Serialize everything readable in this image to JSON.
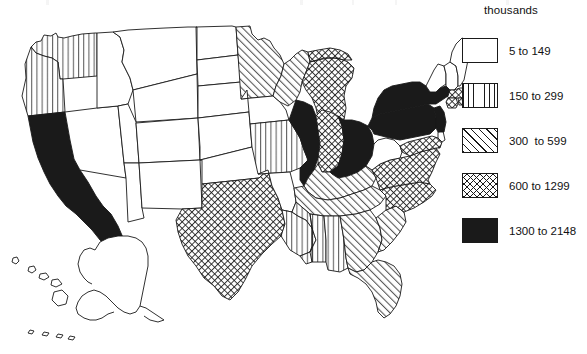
{
  "legend": {
    "title": "thousands",
    "classes": [
      {
        "pattern": "blank",
        "label": "5 to 149",
        "color": "#ffffff"
      },
      {
        "pattern": "vertical",
        "label": "150 to 299",
        "color": "#ffffff"
      },
      {
        "pattern": "diagonal",
        "label": "300  to 599",
        "color": "#ffffff"
      },
      {
        "pattern": "crosshatch",
        "label": "600 to 1299",
        "color": "#ffffff"
      },
      {
        "pattern": "solid",
        "label": "1300 to 2148",
        "color": "#1a1a1a"
      }
    ]
  },
  "chart_data": {
    "type": "map",
    "title": "",
    "units": "thousands",
    "legend_position": "right",
    "classes": [
      "5 to 149",
      "150 to 299",
      "300  to 599",
      "600 to 1299",
      "1300 to 2148"
    ],
    "class_patterns": [
      "blank",
      "vertical",
      "diagonal",
      "crosshatch",
      "solid"
    ],
    "states": [
      {
        "code": "WA",
        "name": "Washington",
        "class": 1
      },
      {
        "code": "OR",
        "name": "Oregon",
        "class": 1
      },
      {
        "code": "CA",
        "name": "California",
        "class": 4
      },
      {
        "code": "NV",
        "name": "Nevada",
        "class": 0
      },
      {
        "code": "ID",
        "name": "Idaho",
        "class": 0
      },
      {
        "code": "MT",
        "name": "Montana",
        "class": 0
      },
      {
        "code": "WY",
        "name": "Wyoming",
        "class": 0
      },
      {
        "code": "UT",
        "name": "Utah",
        "class": 0
      },
      {
        "code": "AZ",
        "name": "Arizona",
        "class": 0
      },
      {
        "code": "CO",
        "name": "Colorado",
        "class": 0
      },
      {
        "code": "NM",
        "name": "New Mexico",
        "class": 0
      },
      {
        "code": "ND",
        "name": "North Dakota",
        "class": 0
      },
      {
        "code": "SD",
        "name": "South Dakota",
        "class": 0
      },
      {
        "code": "NE",
        "name": "Nebraska",
        "class": 0
      },
      {
        "code": "KS",
        "name": "Kansas",
        "class": 0
      },
      {
        "code": "OK",
        "name": "Oklahoma",
        "class": 0
      },
      {
        "code": "TX",
        "name": "Texas",
        "class": 3
      },
      {
        "code": "MN",
        "name": "Minnesota",
        "class": 2
      },
      {
        "code": "IA",
        "name": "Iowa",
        "class": 0
      },
      {
        "code": "MO",
        "name": "Missouri",
        "class": 1
      },
      {
        "code": "AR",
        "name": "Arkansas",
        "class": 0
      },
      {
        "code": "LA",
        "name": "Louisiana",
        "class": 1
      },
      {
        "code": "WI",
        "name": "Wisconsin",
        "class": 2
      },
      {
        "code": "IL",
        "name": "Illinois",
        "class": 4
      },
      {
        "code": "MI",
        "name": "Michigan",
        "class": 3
      },
      {
        "code": "IN",
        "name": "Indiana",
        "class": 3
      },
      {
        "code": "OH",
        "name": "Ohio",
        "class": 4
      },
      {
        "code": "KY",
        "name": "Kentucky",
        "class": 2
      },
      {
        "code": "TN",
        "name": "Tennessee",
        "class": 2
      },
      {
        "code": "MS",
        "name": "Mississippi",
        "class": 1
      },
      {
        "code": "AL",
        "name": "Alabama",
        "class": 1
      },
      {
        "code": "GA",
        "name": "Georgia",
        "class": 2
      },
      {
        "code": "FL",
        "name": "Florida",
        "class": 2
      },
      {
        "code": "SC",
        "name": "South Carolina",
        "class": 2
      },
      {
        "code": "NC",
        "name": "North Carolina",
        "class": 3
      },
      {
        "code": "VA",
        "name": "Virginia",
        "class": 3
      },
      {
        "code": "WV",
        "name": "West Virginia",
        "class": 0
      },
      {
        "code": "MD",
        "name": "Maryland",
        "class": 3
      },
      {
        "code": "DE",
        "name": "Delaware",
        "class": 0
      },
      {
        "code": "PA",
        "name": "Pennsylvania",
        "class": 4
      },
      {
        "code": "NJ",
        "name": "New Jersey",
        "class": 4
      },
      {
        "code": "NY",
        "name": "New York",
        "class": 4
      },
      {
        "code": "CT",
        "name": "Connecticut",
        "class": 3
      },
      {
        "code": "RI",
        "name": "Rhode Island",
        "class": 3
      },
      {
        "code": "MA",
        "name": "Massachusetts",
        "class": 3
      },
      {
        "code": "VT",
        "name": "Vermont",
        "class": 0
      },
      {
        "code": "NH",
        "name": "New Hampshire",
        "class": 0
      },
      {
        "code": "ME",
        "name": "Maine",
        "class": 0
      },
      {
        "code": "AK",
        "name": "Alaska",
        "class": 0
      },
      {
        "code": "HI",
        "name": "Hawaii",
        "class": 0
      }
    ]
  }
}
